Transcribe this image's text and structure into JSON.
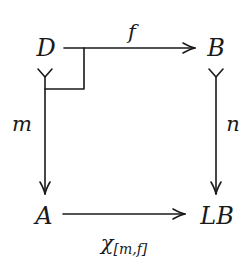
{
  "diagram": {
    "type": "commutative-square",
    "objects": {
      "top_left": "D",
      "top_right": "B",
      "bottom_left": "A",
      "bottom_right": "LB"
    },
    "morphisms": {
      "top": {
        "from": "D",
        "to": "B",
        "label": "f"
      },
      "left": {
        "from": "D",
        "to": "A",
        "label": "m",
        "style": "mono"
      },
      "right": {
        "from": "B",
        "to": "LB",
        "label": "n",
        "style": "mono"
      },
      "bottom": {
        "from": "A",
        "to": "LB",
        "label_main": "χ",
        "label_sub": "[m,f]"
      }
    },
    "annotations": {
      "pullback_corner": "D"
    },
    "colors": {
      "ink": "#1a1a1a",
      "background": "#ffffff"
    }
  }
}
